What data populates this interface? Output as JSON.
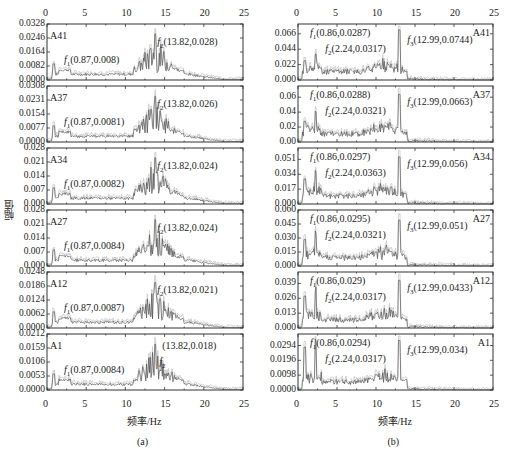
{
  "chart_data": [
    {
      "type": "line",
      "caption": "(a)",
      "xlabel": "频率/Hz",
      "ylabel": "幅值",
      "xlim": [
        0,
        25
      ],
      "xticks": [
        "0",
        "5",
        "10",
        "15",
        "20",
        "25"
      ],
      "panels": [
        {
          "name": "A41",
          "yticks": [
            "0.0000",
            "0.0082",
            "0.0164",
            "0.0246",
            "0.0328"
          ],
          "ymax": 0.0328,
          "peaks": [
            {
              "label": "f1",
              "text": "(0.87,0.008)",
              "x": 0.87,
              "y": 0.008
            },
            {
              "label": "f2",
              "text": "(13.82,0.028)",
              "x": 13.82,
              "y": 0.028
            }
          ]
        },
        {
          "name": "A37",
          "yticks": [
            "0.0000",
            "0.0077",
            "0.0154",
            "0.0231",
            "0.0308"
          ],
          "ymax": 0.0308,
          "peaks": [
            {
              "label": "f1",
              "text": "(0.87,0.0081)",
              "x": 0.87,
              "y": 0.0081
            },
            {
              "label": "f2",
              "text": "(13.82,0.026)",
              "x": 13.82,
              "y": 0.026
            }
          ]
        },
        {
          "name": "A34",
          "yticks": [
            "0.000",
            "0.007",
            "0.014",
            "0.021",
            "0.028"
          ],
          "ymax": 0.028,
          "peaks": [
            {
              "label": "f1",
              "text": "(0.87,0.0082)",
              "x": 0.87,
              "y": 0.0082
            },
            {
              "label": "f2",
              "text": "(13.82,0.024)",
              "x": 13.82,
              "y": 0.024
            }
          ]
        },
        {
          "name": "A27",
          "yticks": [
            "0.000",
            "0.007",
            "0.014",
            "0.021",
            "0.028"
          ],
          "ymax": 0.028,
          "peaks": [
            {
              "label": "f1",
              "text": "(0.87,0.0084)",
              "x": 0.87,
              "y": 0.0084
            },
            {
              "label": "f2",
              "text": "(13.82,0.024)",
              "x": 13.82,
              "y": 0.024
            }
          ]
        },
        {
          "name": "A12",
          "yticks": [
            "0.0000",
            "0.0062",
            "0.0124",
            "0.0186",
            "0.0248"
          ],
          "ymax": 0.0248,
          "peaks": [
            {
              "label": "f1",
              "text": "(0.87,0.0087)",
              "x": 0.87,
              "y": 0.0087
            },
            {
              "label": "f2",
              "text": "(13.82,0.021)",
              "x": 13.82,
              "y": 0.021
            }
          ]
        },
        {
          "name": "A1",
          "yticks": [
            "0.0000",
            "0.0053",
            "0.0106",
            "0.0159",
            "0.0212"
          ],
          "ymax": 0.0212,
          "peaks": [
            {
              "label": "f1",
              "text": "(0.87,0.0084)",
              "x": 0.87,
              "y": 0.0084
            },
            {
              "label": "f2",
              "text": "(13.82,0.018)",
              "x": 13.82,
              "y": 0.018
            }
          ]
        }
      ]
    },
    {
      "type": "line",
      "caption": "(b)",
      "xlabel": "频率/Hz",
      "ylabel": "",
      "xlim": [
        0,
        25
      ],
      "xticks": [
        "0",
        "5",
        "10",
        "15",
        "20",
        "25"
      ],
      "panels": [
        {
          "name": "A41",
          "yticks": [
            "0.000",
            "0.022",
            "0.044",
            "0.066"
          ],
          "ymax": 0.08,
          "peaks": [
            {
              "label": "f1",
              "text": "(0.86,0.0287)",
              "x": 0.86,
              "y": 0.0287
            },
            {
              "label": "f2",
              "text": "(2.24,0.0317)",
              "x": 2.24,
              "y": 0.0317
            },
            {
              "label": "f3",
              "text": "(12.99,0.0744)",
              "x": 12.99,
              "y": 0.0744
            }
          ]
        },
        {
          "name": "A37",
          "yticks": [
            "0.00",
            "0.02",
            "0.04",
            "0.06"
          ],
          "ymax": 0.075,
          "peaks": [
            {
              "label": "f1",
              "text": "(0.86,0.0288)",
              "x": 0.86,
              "y": 0.0288
            },
            {
              "label": "f2",
              "text": "(2.24,0.0321)",
              "x": 2.24,
              "y": 0.0321
            },
            {
              "label": "f3",
              "text": "(12.99,0.0663)",
              "x": 12.99,
              "y": 0.0663
            }
          ]
        },
        {
          "name": "A34",
          "yticks": [
            "0.000",
            "0.017",
            "0.034",
            "0.051"
          ],
          "ymax": 0.064,
          "peaks": [
            {
              "label": "f1",
              "text": "(0.86,0.0297)",
              "x": 0.86,
              "y": 0.0297
            },
            {
              "label": "f2",
              "text": "(2.24,0.0363)",
              "x": 2.24,
              "y": 0.0363
            },
            {
              "label": "f3",
              "text": "(12.99,0.056)",
              "x": 12.99,
              "y": 0.056
            }
          ]
        },
        {
          "name": "A27",
          "yticks": [
            "0.000",
            "0.015",
            "0.030",
            "0.045",
            "0.060"
          ],
          "ymax": 0.06,
          "peaks": [
            {
              "label": "f1",
              "text": "(0.86,0.0295)",
              "x": 0.86,
              "y": 0.0295
            },
            {
              "label": "f2",
              "text": "(2.24,0.0321)",
              "x": 2.24,
              "y": 0.0321
            },
            {
              "label": "f3",
              "text": "(12.99,0.051)",
              "x": 12.99,
              "y": 0.051
            }
          ]
        },
        {
          "name": "A12",
          "yticks": [
            "0.000",
            "0.013",
            "0.026",
            "0.039"
          ],
          "ymax": 0.049,
          "peaks": [
            {
              "label": "f1",
              "text": "(0.86,0.029)",
              "x": 0.86,
              "y": 0.029
            },
            {
              "label": "f2",
              "text": "(2.24,0.0317)",
              "x": 2.24,
              "y": 0.0317
            },
            {
              "label": "f3",
              "text": "(12.99,0.0433)",
              "x": 12.99,
              "y": 0.0433
            }
          ]
        },
        {
          "name": "A1",
          "yticks": [
            "0.0000",
            "0.0098",
            "0.0196",
            "0.0294"
          ],
          "ymax": 0.037,
          "peaks": [
            {
              "label": "f1",
              "text": "(0.86,0.0294)",
              "x": 0.86,
              "y": 0.0294
            },
            {
              "label": "f2",
              "text": "(2.24,0.0317)",
              "x": 2.24,
              "y": 0.0317
            },
            {
              "label": "f3",
              "text": "(12.99,0.034)",
              "x": 12.99,
              "y": 0.034
            }
          ]
        }
      ]
    }
  ]
}
